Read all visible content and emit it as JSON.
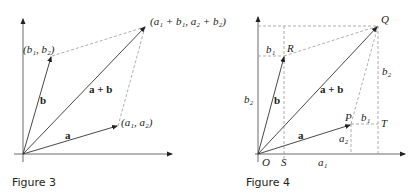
{
  "figures": [
    {
      "id": "figure-3",
      "caption": "Figure 3",
      "labels": {
        "b_point": "(b₁, b₂)",
        "sum_point": "(a₁ + b₁, a₂ + b₂)",
        "a_point": "(a₁, a₂)",
        "vec_a": "a",
        "vec_b": "b",
        "vec_sum": "a + b"
      }
    },
    {
      "id": "figure-4",
      "caption": "Figure 4",
      "labels": {
        "Q": "Q",
        "R": "R",
        "P": "P",
        "T": "T",
        "O": "O",
        "S": "S",
        "b1_top": "b₁",
        "b1_right": "b₁",
        "b2_left": "b₂",
        "b2_right": "b₂",
        "a1": "a₁",
        "a2": "a₂",
        "vec_a": "a",
        "vec_b": "b",
        "vec_sum": "a + b"
      }
    }
  ],
  "colors": {
    "stroke": "#333333",
    "dashed": "#999999",
    "text": "#222222"
  }
}
